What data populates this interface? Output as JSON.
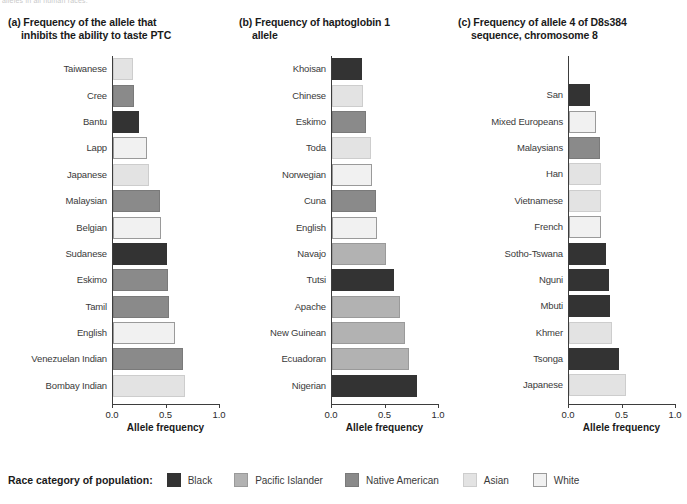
{
  "running_head": "alleles in all human races.",
  "legend": {
    "title": "Race category of population:",
    "items": [
      {
        "label": "Black",
        "color": "#333333",
        "border": "#333333"
      },
      {
        "label": "Pacific Islander",
        "color": "#b2b2b2",
        "border": "#9a9a9a"
      },
      {
        "label": "Native American",
        "color": "#8a8a8a",
        "border": "#7a7a7a"
      },
      {
        "label": "Asian",
        "color": "#e3e3e3",
        "border": "#cdcdcd"
      },
      {
        "label": "White",
        "color": "#f1f1f1",
        "border": "#9a9a9a"
      }
    ]
  },
  "axis": {
    "ticks": [
      "0.0",
      "0.5",
      "1.0"
    ],
    "tick_values": [
      0.0,
      0.5,
      1.0
    ],
    "title": "Allele frequency",
    "min": 0.0,
    "max": 1.0
  },
  "panels": [
    {
      "tag": "(a)",
      "title_line1": "(a) Frequency of the allele that",
      "title_line2": "inhibits the ability to taste PTC",
      "label_width": 112,
      "top_pad": 0
    },
    {
      "tag": "(b)",
      "title_line1": "(b) Frequency of haptoglobin 1",
      "title_line2": "allele",
      "label_width": 100,
      "top_pad": 0
    },
    {
      "tag": "(c)",
      "title_line1": "(c) Frequency of allele 4 of D8s384",
      "title_line2": "sequence, chromosome 8",
      "label_width": 118,
      "top_pad": 26
    }
  ],
  "chart_data": [
    {
      "type": "bar",
      "orientation": "horizontal",
      "title": "(a) Frequency of the allele that inhibits the ability to taste PTC",
      "xlabel": "Allele frequency",
      "ylabel": "",
      "xlim": [
        0.0,
        1.0
      ],
      "xticks": [
        0.0,
        0.5,
        1.0
      ],
      "grid": false,
      "legend_position": "bottom",
      "categories": [
        "Taiwanese",
        "Cree",
        "Bantu",
        "Lapp",
        "Japanese",
        "Malaysian",
        "Belgian",
        "Sudanese",
        "Eskimo",
        "Tamil",
        "English",
        "Venezuelan Indian",
        "Bombay Indian"
      ],
      "values": [
        0.19,
        0.2,
        0.24,
        0.32,
        0.34,
        0.44,
        0.45,
        0.5,
        0.51,
        0.52,
        0.58,
        0.65,
        0.67
      ],
      "race_categories": [
        "Asian",
        "Native American",
        "Black",
        "White",
        "Asian",
        "Native American",
        "White",
        "Black",
        "Native American",
        "Native American",
        "White",
        "Native American",
        "Asian"
      ]
    },
    {
      "type": "bar",
      "orientation": "horizontal",
      "title": "(b) Frequency of haptoglobin 1 allele",
      "xlabel": "Allele frequency",
      "ylabel": "",
      "xlim": [
        0.0,
        1.0
      ],
      "xticks": [
        0.0,
        0.5,
        1.0
      ],
      "grid": false,
      "legend_position": "bottom",
      "categories": [
        "Khoisan",
        "Chinese",
        "Eskimo",
        "Toda",
        "Norwegian",
        "Cuna",
        "English",
        "Navajo",
        "Tutsi",
        "Apache",
        "New Guinean",
        "Ecuadoran",
        "Nigerian"
      ],
      "values": [
        0.28,
        0.29,
        0.32,
        0.36,
        0.37,
        0.41,
        0.42,
        0.5,
        0.58,
        0.64,
        0.68,
        0.72,
        0.79
      ],
      "race_categories": [
        "Black",
        "Asian",
        "Native American",
        "Asian",
        "White",
        "Native American",
        "White",
        "Pacific Islander",
        "Black",
        "Pacific Islander",
        "Pacific Islander",
        "Pacific Islander",
        "Black"
      ]
    },
    {
      "type": "bar",
      "orientation": "horizontal",
      "title": "(c) Frequency of allele 4 of D8s384 sequence, chromosome 8",
      "xlabel": "Allele frequency",
      "ylabel": "",
      "xlim": [
        0.0,
        1.0
      ],
      "xticks": [
        0.0,
        0.5,
        1.0
      ],
      "grid": false,
      "legend_position": "bottom",
      "categories": [
        "San",
        "Mixed Europeans",
        "Malaysians",
        "Han",
        "Vietnamese",
        "French",
        "Sotho-Tswana",
        "Nguni",
        "Mbuti",
        "Khmer",
        "Tsonga",
        "Japanese"
      ],
      "values": [
        0.2,
        0.25,
        0.29,
        0.3,
        0.3,
        0.3,
        0.35,
        0.37,
        0.38,
        0.4,
        0.47,
        0.53
      ],
      "race_categories": [
        "Black",
        "White",
        "Native American",
        "Asian",
        "Asian",
        "White",
        "Black",
        "Black",
        "Black",
        "Asian",
        "Black",
        "Asian"
      ]
    }
  ]
}
